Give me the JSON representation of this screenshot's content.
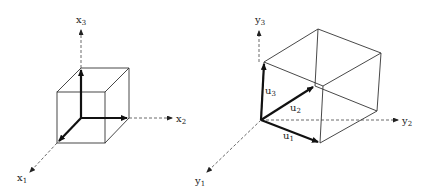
{
  "figure": {
    "left_panel": {
      "axes": [
        {
          "name": "x1",
          "base": "x",
          "sub": "1"
        },
        {
          "name": "x2",
          "base": "x",
          "sub": "2"
        },
        {
          "name": "x3",
          "base": "x",
          "sub": "3"
        }
      ],
      "shape": "unit cube"
    },
    "right_panel": {
      "axes": [
        {
          "name": "y1",
          "base": "y",
          "sub": "1"
        },
        {
          "name": "y2",
          "base": "y",
          "sub": "2"
        },
        {
          "name": "y3",
          "base": "y",
          "sub": "3"
        }
      ],
      "vectors": [
        {
          "name": "u1",
          "base": "u",
          "sub": "1"
        },
        {
          "name": "u2",
          "base": "u",
          "sub": "2"
        },
        {
          "name": "u3",
          "base": "u",
          "sub": "3"
        }
      ],
      "shape": "parallelepiped spanned by u1, u2, u3"
    }
  },
  "colors": {
    "line": "#333333",
    "background": "#ffffff"
  }
}
